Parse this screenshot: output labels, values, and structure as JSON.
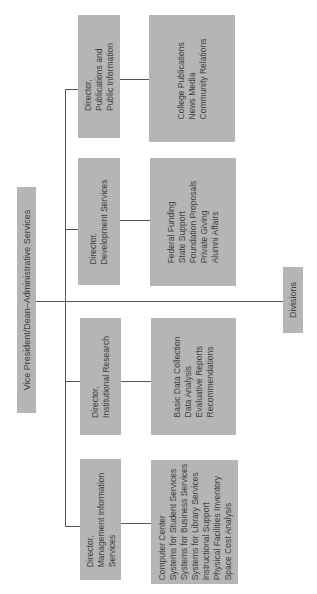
{
  "chart": {
    "top": {
      "label": "Vice President/Dean–Administrative Services"
    },
    "divisions_label": "Divisions",
    "directors": [
      {
        "title_lines": [
          "Director,",
          "Publications and",
          "Public Information"
        ],
        "functions": [
          "College Publications",
          "News Media",
          "Community Relations"
        ]
      },
      {
        "title_lines": [
          "Director,",
          "Development Services"
        ],
        "functions": [
          "Federal Funding",
          "State Support",
          "Foundation Proposals",
          "Private Giving",
          "Alumni Affairs"
        ]
      },
      {
        "title_lines": [
          "Director,",
          "Institutional Research"
        ],
        "functions": [
          "Basic Data Collection",
          "Data Analysis",
          "Evaluative Reports",
          "Recommendations"
        ]
      },
      {
        "title_lines": [
          "Director,",
          "Management Information",
          "Services"
        ],
        "functions": [
          "Computer Center",
          "Systems for Student Services",
          "Systems for Business Services",
          "Systems for Library Services",
          "Instructional Support",
          "Physical Facilities Inventory",
          "Space Cost Analysis"
        ]
      }
    ],
    "colors": {
      "box": "#b5b5b5",
      "line": "#555555",
      "text": "#3e3e3e"
    }
  }
}
